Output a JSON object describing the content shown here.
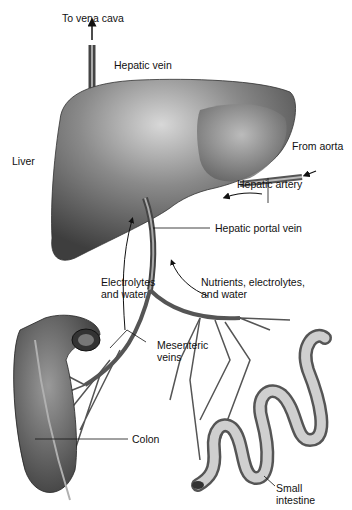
{
  "diagram": {
    "labels": {
      "to_vena_cava": "To vena cava",
      "hepatic_vein": "Hepatic vein",
      "liver": "Liver",
      "from_aorta": "From aorta",
      "hepatic_artery": "Hepatic artery",
      "hepatic_portal_vein": "Hepatic portal vein",
      "electrolytes_water_1": "Electrolytes",
      "electrolytes_water_2": "and water",
      "nutrients_1": "Nutrients, electrolytes,",
      "nutrients_2": "and water",
      "mesenteric_1": "Mesenteric",
      "mesenteric_2": "veins",
      "colon": "Colon",
      "small_intestine_1": "Small",
      "small_intestine_2": "intestine"
    }
  }
}
